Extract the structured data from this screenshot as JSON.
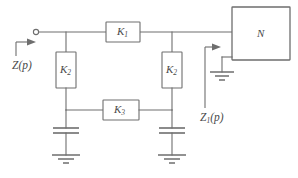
{
  "figure": {
    "type": "circuit-diagram",
    "title": ""
  },
  "components": {
    "k1": {
      "label": "K",
      "subscript": "1",
      "kind": "series-block"
    },
    "k2_left": {
      "label": "K",
      "subscript": "2",
      "kind": "shunt-block"
    },
    "k2_right": {
      "label": "K",
      "subscript": "2",
      "kind": "shunt-block"
    },
    "k3": {
      "label": "K",
      "subscript": "3",
      "kind": "bridging-block"
    },
    "n_box": {
      "label": "N",
      "kind": "network-block"
    },
    "capacitor_left": {
      "kind": "capacitor"
    },
    "capacitor_right": {
      "kind": "capacitor"
    },
    "ground_left": {
      "kind": "ground-symbol"
    },
    "ground_right": {
      "kind": "ground-symbol"
    },
    "ground_n": {
      "kind": "ground-symbol"
    },
    "input_terminal": {
      "kind": "open-circle-terminal"
    }
  },
  "annotations": {
    "z_input": {
      "label": "Z",
      "subscript": "",
      "suffix": "(p)"
    },
    "z1_internal": {
      "label": "Z",
      "subscript": "1",
      "suffix": "(p)"
    },
    "arrow_input": {
      "name": "input-impedance-arrow",
      "direction": "right"
    },
    "arrow_internal": {
      "name": "internal-impedance-arrow",
      "direction": "right"
    }
  },
  "colors": {
    "line": "#6e6e6e",
    "text": "#4a4a4a",
    "background": "#ffffff"
  }
}
